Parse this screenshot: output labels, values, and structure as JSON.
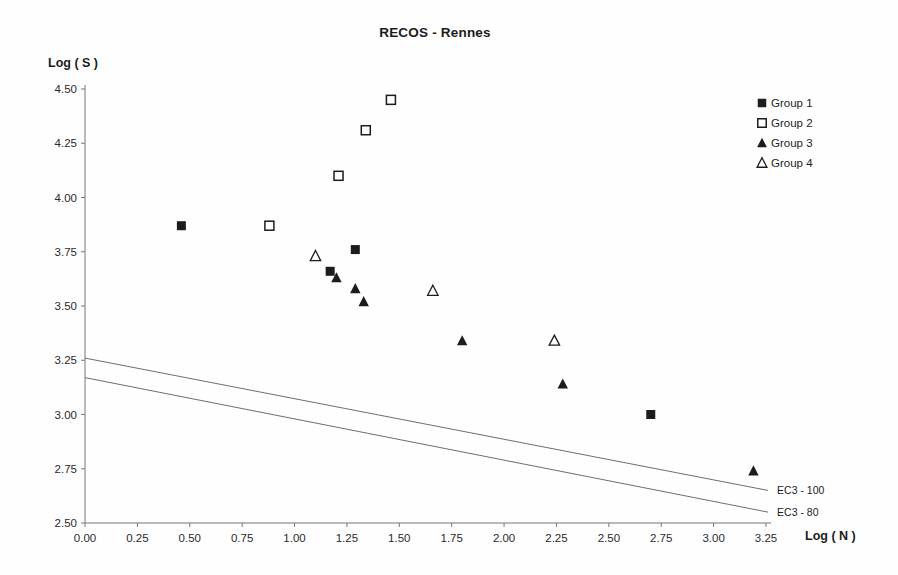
{
  "title": "RECOS - Rennes",
  "chart_data": {
    "type": "scatter",
    "title": "RECOS - Rennes",
    "xlabel": "Log ( N )",
    "ylabel": "Log ( S )",
    "xlim": [
      0.0,
      3.25
    ],
    "ylim": [
      2.5,
      4.5
    ],
    "grid": false,
    "legend_position": "top-right",
    "x_ticks": [
      "0.00",
      "0.25",
      "0.50",
      "0.75",
      "1.00",
      "1.25",
      "1.50",
      "1.75",
      "2.00",
      "2.25",
      "2.50",
      "2.75",
      "3.00",
      "3.25"
    ],
    "y_ticks": [
      "4.50",
      "4.25",
      "4.00",
      "3.75",
      "3.50",
      "3.25",
      "3.00",
      "2.75",
      "2.50"
    ],
    "series": [
      {
        "name": "Group 1",
        "marker": "filled-square",
        "points": [
          [
            0.46,
            3.87
          ],
          [
            1.17,
            3.66
          ],
          [
            1.29,
            3.76
          ],
          [
            2.7,
            3.0
          ]
        ]
      },
      {
        "name": "Group 2",
        "marker": "open-square",
        "points": [
          [
            0.88,
            3.87
          ],
          [
            1.21,
            4.1
          ],
          [
            1.34,
            4.31
          ],
          [
            1.46,
            4.45
          ]
        ]
      },
      {
        "name": "Group 3",
        "marker": "filled-triangle",
        "points": [
          [
            1.2,
            3.63
          ],
          [
            1.29,
            3.58
          ],
          [
            1.33,
            3.52
          ],
          [
            1.8,
            3.34
          ],
          [
            2.28,
            3.14
          ],
          [
            3.19,
            2.74
          ]
        ]
      },
      {
        "name": "Group 4",
        "marker": "open-triangle",
        "points": [
          [
            1.1,
            3.73
          ],
          [
            1.66,
            3.57
          ],
          [
            2.24,
            3.34
          ]
        ]
      }
    ],
    "reference_lines": [
      {
        "label": "EC3 - 100",
        "from": [
          0.0,
          3.26
        ],
        "to": [
          3.26,
          2.65
        ]
      },
      {
        "label": "EC3 - 80",
        "from": [
          0.0,
          3.17
        ],
        "to": [
          3.26,
          2.55
        ]
      }
    ]
  },
  "colors": {
    "ink": "#1c1c1c",
    "tick_text": "#2a2a2a",
    "axis": "#777777",
    "ref_line": "#6e6e6e",
    "background": "#fefefe"
  }
}
